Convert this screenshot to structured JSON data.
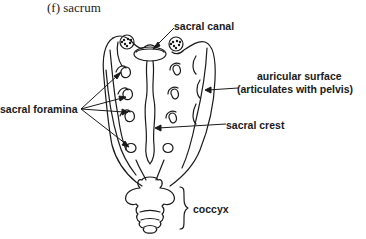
{
  "figure": {
    "title": "(f)  sacrum"
  },
  "labels": {
    "sacral_canal": "sacral canal",
    "auricular_surface_line1": "auricular surface",
    "auricular_surface_line2": "(articulates with pelvis)",
    "sacral_foramina": "sacral foramina",
    "sacral_crest": "sacral crest",
    "coccyx": "coccyx"
  },
  "colors": {
    "line": "#1a1a1a",
    "background": "#ffffff"
  }
}
